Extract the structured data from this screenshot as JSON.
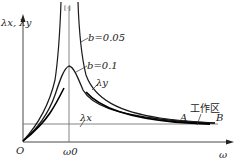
{
  "diagram": {
    "type": "resonance-curve",
    "axes": {
      "y_label": "λx, λy",
      "x_label": "ω",
      "origin_label": "O",
      "x_marker_label": "ω0"
    },
    "curves": [
      {
        "name": "b=0.05",
        "label": "b=0.05"
      },
      {
        "name": "b=0.1",
        "label": "b=0.1"
      },
      {
        "name": "lambda-y",
        "label": "λy"
      },
      {
        "name": "lambda-x",
        "label": "λx"
      }
    ],
    "annotations": {
      "working_zone": "工作区",
      "point_a": "A",
      "point_b": "B"
    },
    "colors": {
      "line": "#1a1a1a",
      "thin_line": "#555555",
      "background": "#ffffff"
    }
  }
}
